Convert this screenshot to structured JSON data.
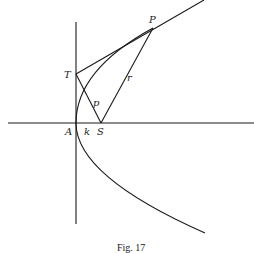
{
  "figure": {
    "caption": "Fig. 17",
    "labels": {
      "P": "P",
      "T": "T",
      "A": "A",
      "k": "k",
      "S": "S",
      "p": "p",
      "r": "r"
    }
  }
}
